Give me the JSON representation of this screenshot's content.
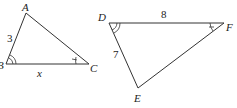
{
  "figure": {
    "triangle_abc": {
      "vertices": {
        "A": "A",
        "B": "B",
        "C": "C"
      },
      "side_ab": "3",
      "side_bc": "x"
    },
    "triangle_def": {
      "vertices": {
        "D": "D",
        "E": "E",
        "F": "F"
      },
      "side_df": "8",
      "side_de": "7"
    },
    "colors": {
      "stroke": "#333333",
      "text": "#222222"
    }
  }
}
